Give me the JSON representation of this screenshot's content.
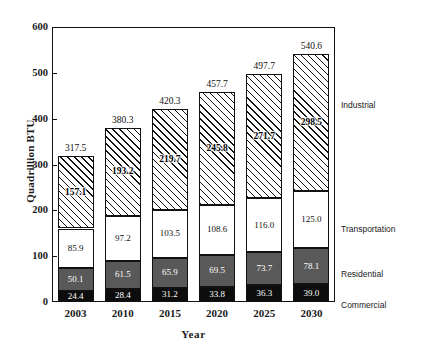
{
  "chart_data": {
    "type": "bar",
    "subtype": "stacked",
    "title": "",
    "xlabel": "Year",
    "ylabel": "Quadrillion BTU",
    "categories": [
      "2003",
      "2010",
      "2015",
      "2020",
      "2025",
      "2030"
    ],
    "ylim": [
      0,
      600
    ],
    "yticks": [
      0,
      100,
      200,
      300,
      400,
      500,
      600
    ],
    "ytick_labels": [
      "0",
      "100",
      "200",
      "300",
      "400",
      "500",
      "600"
    ],
    "grid": false,
    "legend_position": "right-outside",
    "series": [
      {
        "name": "Commercial",
        "fill": "solid-black",
        "color": "#0d0d0d",
        "label_color": "#ffffff",
        "values": [
          24.4,
          28.4,
          31.2,
          33.8,
          36.3,
          39.0
        ],
        "labels": [
          "24.4",
          "28.4",
          "31.2",
          "33.8",
          "36.3",
          "39.0"
        ]
      },
      {
        "name": "Residential",
        "fill": "solid-gray",
        "color": "#595959",
        "label_color": "#ffffff",
        "values": [
          50.1,
          61.5,
          65.9,
          69.5,
          73.7,
          78.1
        ],
        "labels": [
          "50.1",
          "61.5",
          "65.9",
          "69.5",
          "73.7",
          "78.1"
        ]
      },
      {
        "name": "Transportation",
        "fill": "solid-white",
        "color": "#ffffff",
        "label_color": "#111111",
        "values": [
          85.9,
          97.2,
          103.5,
          108.6,
          116.0,
          125.0
        ],
        "labels": [
          "85.9",
          "97.2",
          "103.5",
          "108.6",
          "116.0",
          "125.0"
        ]
      },
      {
        "name": "Industrial",
        "fill": "diagonal-hatch",
        "color": "#ffffff",
        "label_color": "#000000",
        "values": [
          157.1,
          193.2,
          219.7,
          245.8,
          271.7,
          298.5
        ],
        "labels": [
          "157.1",
          "193.2",
          "219.7",
          "245.8",
          "271.7",
          "298.5"
        ]
      }
    ],
    "totals": [
      317.5,
      380.3,
      420.3,
      457.7,
      497.7,
      540.6
    ],
    "total_labels": [
      "317.5",
      "380.3",
      "420.3",
      "457.7",
      "497.7",
      "540.6"
    ],
    "legend_entries": [
      {
        "label": "Industrial",
        "y": 100
      },
      {
        "label": "Transportation",
        "y": 224
      },
      {
        "label": "Residential",
        "y": 269
      },
      {
        "label": "Commercial",
        "y": 300
      }
    ]
  }
}
